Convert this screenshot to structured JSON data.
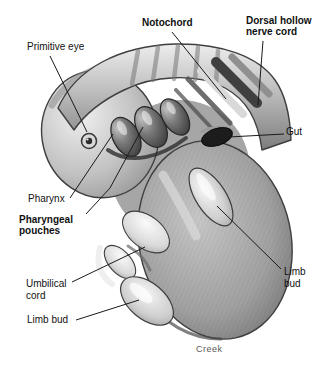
{
  "figure": {
    "signature": "Creek"
  },
  "labels": {
    "primitive_eye": {
      "text": "Primitive eye",
      "bold": false
    },
    "notochord": {
      "text": "Notochord",
      "bold": true
    },
    "dorsal_hollow_nerve_cord": {
      "text": "Dorsal hollow\nnerve cord",
      "bold": true
    },
    "gut": {
      "text": "Gut",
      "bold": false
    },
    "pharynx": {
      "text": "Pharynx",
      "bold": false
    },
    "pharyngeal_pouches": {
      "text": "Pharyngeal\npouches",
      "bold": true
    },
    "umbilical_cord": {
      "text": "Umbilical\ncord",
      "bold": false
    },
    "limb_bud_left": {
      "text": "Limb bud",
      "bold": false
    },
    "limb_bud_right": {
      "text": "Limb\nbud",
      "bold": false
    }
  },
  "palette": {
    "background": "#ffffff",
    "outline": "#3e3e3e",
    "body_light": "#ededed",
    "body_mid": "#aaaaaa",
    "body_dark": "#6e6e6e",
    "groove_dark": "#2e2e2e",
    "label_text": "#111111",
    "signature_text": "#5a5a5a",
    "leader_line": "#1a1a1a"
  }
}
